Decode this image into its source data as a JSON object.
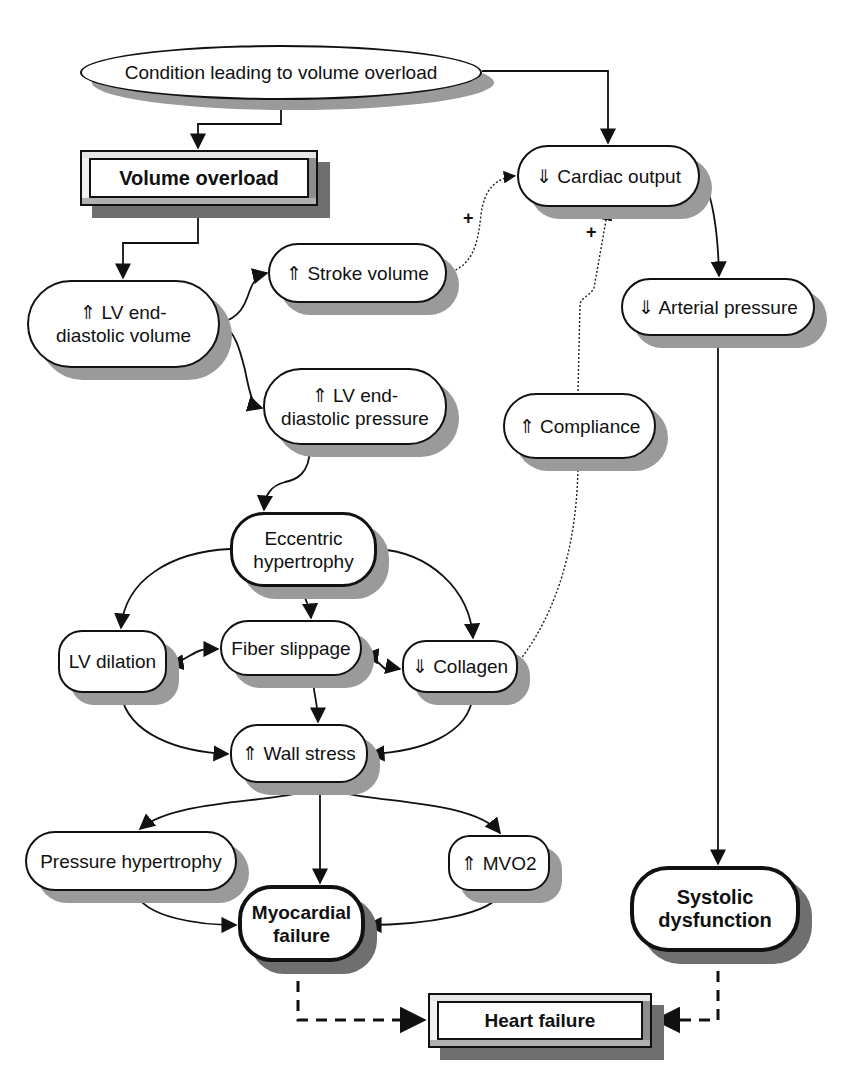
{
  "diagram": {
    "type": "flowchart",
    "topic": "Pathophysiology of volume overload leading to heart failure",
    "nodes": {
      "condition": {
        "label": "Condition leading to volume overload",
        "shape": "ellipse"
      },
      "volume_overload": {
        "label": "Volume overload",
        "shape": "beveled-rect",
        "bold": true
      },
      "cardiac_output": {
        "label": "⇓ Cardiac output",
        "shape": "pill"
      },
      "stroke_volume": {
        "label": "⇑ Stroke volume",
        "shape": "pill"
      },
      "lv_edv": {
        "label_line1": "⇑ LV end-",
        "label_line2": "diastolic volume",
        "shape": "pill"
      },
      "arterial_pressure": {
        "label": "⇓ Arterial pressure",
        "shape": "pill"
      },
      "lv_edp": {
        "label_line1": "⇑ LV end-",
        "label_line2": "diastolic pressure",
        "shape": "pill"
      },
      "compliance": {
        "label": "⇑ Compliance",
        "shape": "pill"
      },
      "eccentric": {
        "label_line1": "Eccentric",
        "label_line2": "hypertrophy",
        "shape": "pill-thick"
      },
      "lv_dilation": {
        "label": "LV dilation",
        "shape": "pill"
      },
      "fiber_slippage": {
        "label": "Fiber slippage",
        "shape": "pill"
      },
      "collagen": {
        "label": "⇓ Collagen",
        "shape": "pill"
      },
      "wall_stress": {
        "label": "⇑ Wall stress",
        "shape": "pill"
      },
      "pressure_hypertrophy": {
        "label": "Pressure hypertrophy",
        "shape": "pill"
      },
      "mvo2": {
        "label": "⇑ MVO2",
        "shape": "pill"
      },
      "myocardial_failure": {
        "label_line1": "Myocardial",
        "label_line2": "failure",
        "shape": "pill-thick",
        "bold": true
      },
      "systolic_dysfunction": {
        "label_line1": "Systolic",
        "label_line2": "dysfunction",
        "shape": "pill-thick",
        "bold": true
      },
      "heart_failure": {
        "label": "Heart failure",
        "shape": "beveled-rect",
        "bold": true
      }
    },
    "edges": [
      {
        "from": "condition",
        "to": "volume_overload",
        "style": "solid"
      },
      {
        "from": "condition",
        "to": "cardiac_output",
        "style": "solid"
      },
      {
        "from": "volume_overload",
        "to": "lv_edv",
        "style": "solid"
      },
      {
        "from": "lv_edv",
        "to": "stroke_volume",
        "style": "solid"
      },
      {
        "from": "lv_edv",
        "to": "lv_edp",
        "style": "solid"
      },
      {
        "from": "stroke_volume",
        "to": "cardiac_output",
        "style": "dotted",
        "sign": "+"
      },
      {
        "from": "compliance",
        "to": "cardiac_output",
        "style": "dotted",
        "sign": "+"
      },
      {
        "from": "cardiac_output",
        "to": "arterial_pressure",
        "style": "solid"
      },
      {
        "from": "arterial_pressure",
        "to": "systolic_dysfunction",
        "style": "solid"
      },
      {
        "from": "lv_edp",
        "to": "eccentric",
        "style": "solid"
      },
      {
        "from": "eccentric",
        "to": "lv_dilation",
        "style": "solid"
      },
      {
        "from": "eccentric",
        "to": "fiber_slippage",
        "style": "solid"
      },
      {
        "from": "eccentric",
        "to": "collagen",
        "style": "solid"
      },
      {
        "from": "lv_dilation",
        "to": "fiber_slippage",
        "style": "solid",
        "bidirectional": true
      },
      {
        "from": "fiber_slippage",
        "to": "collagen",
        "style": "solid",
        "bidirectional": true
      },
      {
        "from": "collagen",
        "to": "compliance",
        "style": "dotted"
      },
      {
        "from": "lv_dilation",
        "to": "wall_stress",
        "style": "solid"
      },
      {
        "from": "fiber_slippage",
        "to": "wall_stress",
        "style": "solid"
      },
      {
        "from": "collagen",
        "to": "wall_stress",
        "style": "solid"
      },
      {
        "from": "wall_stress",
        "to": "pressure_hypertrophy",
        "style": "solid"
      },
      {
        "from": "wall_stress",
        "to": "myocardial_failure",
        "style": "solid"
      },
      {
        "from": "wall_stress",
        "to": "mvo2",
        "style": "solid"
      },
      {
        "from": "pressure_hypertrophy",
        "to": "myocardial_failure",
        "style": "solid"
      },
      {
        "from": "mvo2",
        "to": "myocardial_failure",
        "style": "solid"
      },
      {
        "from": "myocardial_failure",
        "to": "heart_failure",
        "style": "dashed"
      },
      {
        "from": "systolic_dysfunction",
        "to": "heart_failure",
        "style": "dashed"
      }
    ],
    "signs": {
      "stroke_to_co": "+",
      "compliance_to_co": "+"
    }
  },
  "colors": {
    "line": "#111111",
    "shadow": "#9a9a9a",
    "shadow_dark": "#6f6f6f",
    "background": "#ffffff"
  }
}
